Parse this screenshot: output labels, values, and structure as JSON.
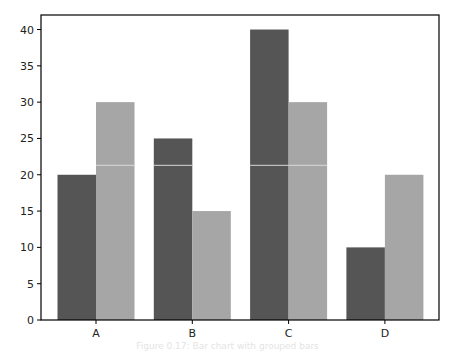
{
  "chart_data": {
    "type": "bar",
    "title": "",
    "xlabel": "",
    "ylabel": "",
    "categories": [
      "A",
      "B",
      "C",
      "D"
    ],
    "series": [
      {
        "name": "Series 1",
        "color": "#555555",
        "values": [
          20,
          25,
          40,
          10
        ]
      },
      {
        "name": "Series 2",
        "color": "#a6a6a6",
        "values": [
          30,
          15,
          30,
          20
        ]
      }
    ],
    "ylim": [
      0,
      42
    ],
    "yticks": [
      0,
      5,
      10,
      15,
      20,
      25,
      30,
      35,
      40
    ],
    "grid": false,
    "legend": null,
    "reference_line": {
      "y": 21.3,
      "color": "#d8d8d8",
      "note": "thin light horizontal line across bars"
    }
  },
  "caption": "Figure 0.17: Bar chart with grouped bars"
}
